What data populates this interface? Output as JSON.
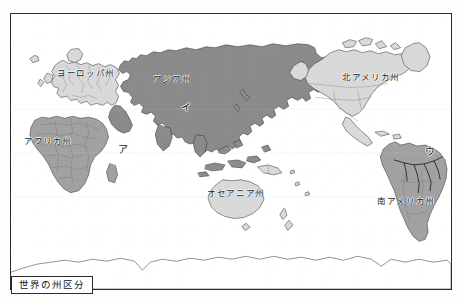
{
  "figure": {
    "caption": "世界の州区分",
    "frame": {
      "border_color": "#2c2c2c",
      "background": "#ffffff"
    }
  },
  "palette": {
    "ocean": "#ffffff",
    "continent_light": "#d9d9d9",
    "continent_medium": "#a3a3a3",
    "continent_dark": "#8c8c8c",
    "coastline": "#3a3a3a",
    "border_line": "#6e6e6e",
    "river_line": "#1f1f1f",
    "label_text": "#1a1a1a"
  },
  "regions": [
    {
      "id": "europe",
      "label": "ヨーロッパ州",
      "x": 86,
      "y": 73,
      "shade": "light"
    },
    {
      "id": "asia",
      "label": "アジア州",
      "x": 172,
      "y": 79,
      "shade": "dark"
    },
    {
      "id": "africa",
      "label": "アフリカ州",
      "x": 48,
      "y": 141,
      "shade": "medium"
    },
    {
      "id": "north-america",
      "label": "北アメリカ州",
      "x": 371,
      "y": 77,
      "shade": "light"
    },
    {
      "id": "south-america",
      "label": "南アメリカ州",
      "x": 406,
      "y": 201,
      "shade": "medium"
    },
    {
      "id": "oceania",
      "label": "オセアニア州",
      "x": 236,
      "y": 193,
      "shade": "light"
    }
  ],
  "markers": [
    {
      "id": "marker-a",
      "label": "ア",
      "x": 123,
      "y": 150
    },
    {
      "id": "marker-i",
      "label": "イ",
      "x": 186,
      "y": 108
    },
    {
      "id": "marker-u",
      "label": "ウ",
      "x": 430,
      "y": 152
    }
  ]
}
